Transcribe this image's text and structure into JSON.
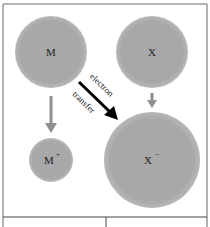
{
  "diagram": {
    "colors": {
      "circle_fill": "#a8a8a8",
      "circle_edge": "#b5b5b5",
      "gray_arrow": "#8f8f8f",
      "black_arrow": "#000000",
      "border": "#555555",
      "background": "#ffffff"
    },
    "nodes": [
      {
        "id": "M",
        "label": "M",
        "superscript": "",
        "cx": 51,
        "cy": 52,
        "r": 36
      },
      {
        "id": "X",
        "label": "X",
        "superscript": "",
        "cx": 152,
        "cy": 52,
        "r": 36
      },
      {
        "id": "M_plus",
        "label": "M",
        "superscript": "+",
        "cx": 51,
        "cy": 160,
        "r": 22
      },
      {
        "id": "X_minus",
        "label": "X",
        "superscript": "−",
        "cx": 152,
        "cy": 160,
        "r": 48
      }
    ],
    "arrows": [
      {
        "from": "M",
        "to": "M_plus",
        "style": "gray"
      },
      {
        "from": "X",
        "to": "X_minus",
        "style": "gray"
      },
      {
        "from": "M",
        "to": "X_minus",
        "style": "black",
        "label_line1": "electron",
        "label_line2": "transfer"
      }
    ]
  }
}
